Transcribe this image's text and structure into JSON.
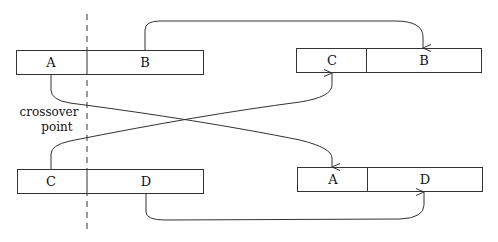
{
  "diagram": {
    "crossover_label_line1": "crossover",
    "crossover_label_line2": "point",
    "parents": [
      {
        "id": "parent-1",
        "segments": [
          {
            "label": "A"
          },
          {
            "label": "B"
          }
        ]
      },
      {
        "id": "parent-2",
        "segments": [
          {
            "label": "C"
          },
          {
            "label": "D"
          }
        ]
      }
    ],
    "offspring": [
      {
        "id": "child-1",
        "segments": [
          {
            "label": "C"
          },
          {
            "label": "B"
          }
        ]
      },
      {
        "id": "child-2",
        "segments": [
          {
            "label": "A"
          },
          {
            "label": "D"
          }
        ]
      }
    ],
    "arrows": [
      {
        "from": "parent-1.B",
        "to": "child-1.B"
      },
      {
        "from": "parent-1.A",
        "to": "child-2.A"
      },
      {
        "from": "parent-2.C",
        "to": "child-1.C"
      },
      {
        "from": "parent-2.D",
        "to": "child-2.D"
      }
    ],
    "colors": {
      "stroke": "#333333",
      "background": "#ffffff"
    }
  }
}
